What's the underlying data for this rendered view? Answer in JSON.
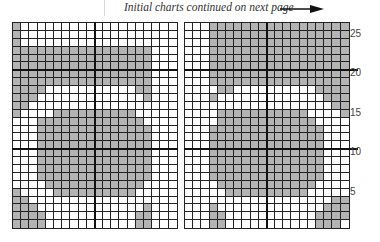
{
  "header": {
    "caption": "Initial charts continued on next page",
    "arrow_icon": "right-arrow"
  },
  "colors": {
    "shaded": "#b3b3b3",
    "empty": "#ffffff",
    "gridline": "#222222"
  },
  "chart_data": {
    "type": "heatmap",
    "columns_per_panel": 20,
    "rows": 26,
    "row_labels": [
      {
        "row": 25,
        "label": "25"
      },
      {
        "row": 20,
        "label": "20"
      },
      {
        "row": 15,
        "label": "15"
      },
      {
        "row": 10,
        "label": "10"
      },
      {
        "row": 5,
        "label": "5"
      }
    ],
    "thick_lines": {
      "horizontal_between_rows": [
        [
          21,
          20
        ],
        [
          11,
          10
        ]
      ],
      "vertical_between_columns": [
        10,
        11
      ]
    },
    "panels": [
      {
        "name": "left",
        "rows_top_to_bottom": [
          "10000000000000000000",
          "10000000000000000000",
          "10000000000000000000",
          "11111111111111111000",
          "11111111111111111000",
          "11111111111111111000",
          "11111111111111111000",
          "11111111111111111000",
          "11110000000000011000",
          "11100000000000001000",
          "11000000000000000000",
          "10000111111111100000",
          "00011111111111110000",
          "00011111111111111000",
          "00011111111111111000",
          "00011111111111111000",
          "00011111111111111000",
          "00011111111111111000",
          "00011111111111111000",
          "00011111111111111000",
          "00001111111111110000",
          "10000111111111100000",
          "11000000000000000000",
          "11100000000000001000",
          "11110000000000011000",
          "11110000000000011000"
        ]
      },
      {
        "name": "right",
        "rows_top_to_bottom": [
          "00011111111111111111",
          "00011111111111111111",
          "00011111111111111111",
          "00011111111111111111",
          "00011111111111111111",
          "00011111111111111111",
          "00011111111111111111",
          "00011111111111111111",
          "00001100000000001111",
          "00010000000000000111",
          "00000000000000000011",
          "00001111111111100001",
          "00001111111111110000",
          "00011111111111111000",
          "00011111111111111000",
          "00011111111111111000",
          "00011111111111111000",
          "00011111111111111000",
          "00011111111111111000",
          "00011111111111111000",
          "00001111111111110000",
          "00000111111111100000",
          "00000000000000000011",
          "00010000000000000111",
          "00011000000000001111",
          "00011000000000001110"
        ]
      }
    ]
  }
}
